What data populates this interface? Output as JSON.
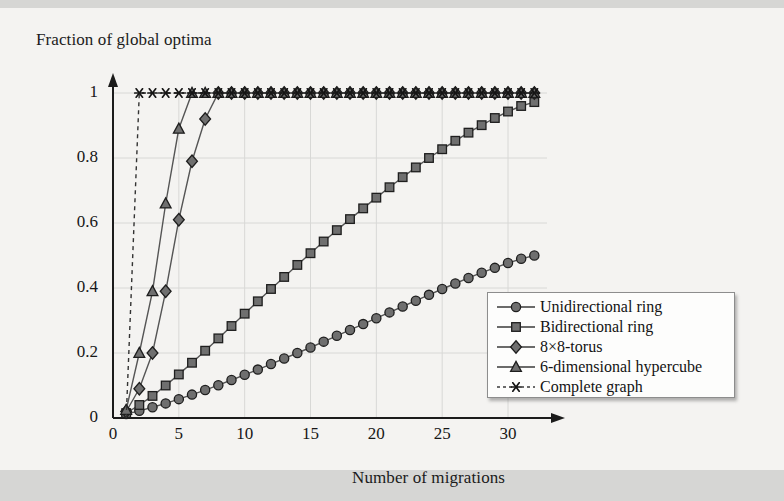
{
  "chart_data": {
    "type": "line",
    "title": "",
    "xlabel": "Number of migrations",
    "ylabel": "Fraction of global optima",
    "xlim": [
      0,
      32.5
    ],
    "ylim": [
      0,
      1.03
    ],
    "xticks": [
      "0",
      "5",
      "10",
      "15",
      "20",
      "25",
      "30"
    ],
    "xtick_values": [
      0,
      5,
      10,
      15,
      20,
      25,
      30
    ],
    "yticks": [
      "0",
      "0.2",
      "0.4",
      "0.6",
      "0.8",
      "1"
    ],
    "ytick_values": [
      0,
      0.2,
      0.4,
      0.6,
      0.8,
      1
    ],
    "grid": true,
    "legend_position": "lower-right",
    "x": [
      1,
      2,
      3,
      4,
      5,
      6,
      7,
      8,
      9,
      10,
      11,
      12,
      13,
      14,
      15,
      16,
      17,
      18,
      19,
      20,
      21,
      22,
      23,
      24,
      25,
      26,
      27,
      28,
      29,
      30,
      31,
      32
    ],
    "series": [
      {
        "name": "Unidirectional ring",
        "marker": "circle",
        "linestyle": "solid",
        "color": "#555555",
        "values": [
          0.012,
          0.022,
          0.033,
          0.045,
          0.058,
          0.072,
          0.086,
          0.101,
          0.117,
          0.133,
          0.149,
          0.166,
          0.183,
          0.2,
          0.217,
          0.235,
          0.253,
          0.271,
          0.289,
          0.307,
          0.325,
          0.343,
          0.361,
          0.379,
          0.397,
          0.414,
          0.431,
          0.447,
          0.462,
          0.477,
          0.49,
          0.5
        ]
      },
      {
        "name": "Bidirectional ring",
        "marker": "square",
        "linestyle": "solid",
        "color": "#555555",
        "values": [
          0.015,
          0.04,
          0.068,
          0.1,
          0.134,
          0.17,
          0.207,
          0.245,
          0.283,
          0.321,
          0.359,
          0.397,
          0.434,
          0.471,
          0.507,
          0.543,
          0.578,
          0.612,
          0.645,
          0.678,
          0.71,
          0.741,
          0.771,
          0.8,
          0.827,
          0.853,
          0.878,
          0.901,
          0.923,
          0.943,
          0.96,
          0.972
        ]
      },
      {
        "name": "8×8-torus",
        "marker": "diamond",
        "linestyle": "solid",
        "color": "#555555",
        "values": [
          0.02,
          0.09,
          0.2,
          0.39,
          0.61,
          0.79,
          0.92,
          1.0,
          1.0,
          1.0,
          1.0,
          1.0,
          1.0,
          1.0,
          1.0,
          1.0,
          1.0,
          1.0,
          1.0,
          1.0,
          1.0,
          1.0,
          1.0,
          1.0,
          1.0,
          1.0,
          1.0,
          1.0,
          1.0,
          1.0,
          1.0,
          1.0
        ]
      },
      {
        "name": "6-dimensional hypercube",
        "marker": "triangle",
        "linestyle": "solid",
        "color": "#555555",
        "values": [
          0.025,
          0.2,
          0.39,
          0.66,
          0.89,
          1.0,
          1.0,
          1.0,
          1.0,
          1.0,
          1.0,
          1.0,
          1.0,
          1.0,
          1.0,
          1.0,
          1.0,
          1.0,
          1.0,
          1.0,
          1.0,
          1.0,
          1.0,
          1.0,
          1.0,
          1.0,
          1.0,
          1.0,
          1.0,
          1.0,
          1.0,
          1.0
        ]
      },
      {
        "name": "Complete graph",
        "marker": "star",
        "linestyle": "dashed",
        "color": "#333333",
        "values": [
          0.0,
          1.0,
          1.0,
          1.0,
          1.0,
          1.0,
          1.0,
          1.0,
          1.0,
          1.0,
          1.0,
          1.0,
          1.0,
          1.0,
          1.0,
          1.0,
          1.0,
          1.0,
          1.0,
          1.0,
          1.0,
          1.0,
          1.0,
          1.0,
          1.0,
          1.0,
          1.0,
          1.0,
          1.0,
          1.0,
          1.0,
          1.0
        ]
      }
    ]
  },
  "axes": {
    "x_title": "Number of migrations",
    "y_title": "Fraction of global optima"
  },
  "legend": {
    "items": [
      {
        "label": "Unidirectional ring",
        "marker": "circle",
        "linestyle": "solid"
      },
      {
        "label": "Bidirectional ring",
        "marker": "square",
        "linestyle": "solid"
      },
      {
        "label": "8×8-torus",
        "marker": "diamond",
        "linestyle": "solid"
      },
      {
        "label": "6-dimensional hypercube",
        "marker": "triangle",
        "linestyle": "solid"
      },
      {
        "label": "Complete graph",
        "marker": "star",
        "linestyle": "dashed"
      }
    ]
  },
  "ticks": {
    "x": [
      "0",
      "5",
      "10",
      "15",
      "20",
      "25",
      "30"
    ],
    "y": [
      "0",
      "0.2",
      "0.4",
      "0.6",
      "0.8",
      "1"
    ]
  },
  "colors": {
    "page_background": "#d6d6d4",
    "sheet_background": "#f4f3f1",
    "axis": "#1b1b1b",
    "grid": "#d8d8d6",
    "marker_fill": "#6f6f6f",
    "marker_edge": "#1e1e1e"
  }
}
